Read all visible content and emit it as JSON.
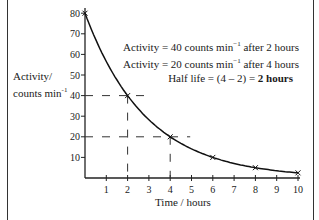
{
  "chart_data": {
    "type": "line",
    "title": "",
    "xlabel": "Time / hours",
    "ylabel": "Activity/ counts min-1",
    "ylabel_line1": "Activity/",
    "ylabel_line2": "counts min",
    "ylabel_sup": "-1",
    "xlim": [
      0,
      10
    ],
    "ylim": [
      0,
      80
    ],
    "x_ticks": [
      1,
      2,
      3,
      4,
      5,
      6,
      7,
      8,
      9,
      10
    ],
    "y_ticks": [
      10,
      20,
      30,
      40,
      50,
      60,
      70,
      80
    ],
    "grid": false,
    "legend": null,
    "series": [
      {
        "name": "Activity decay",
        "x": [
          0,
          2,
          4,
          6,
          8,
          10
        ],
        "y": [
          80,
          40,
          20,
          10,
          5,
          2.5
        ],
        "marker": "x"
      }
    ],
    "guide_lines": [
      {
        "x": 2,
        "y": 40,
        "style": "dashed"
      },
      {
        "x": 4,
        "y": 20,
        "style": "dashed"
      }
    ],
    "annotations": [
      {
        "text": "Activity = 40 counts min-1 after 2 hours"
      },
      {
        "text": "Activity = 20 counts min-1 after 4 hours"
      },
      {
        "text": "Half life = (4 – 2) = 2 hours"
      }
    ]
  },
  "labels": {
    "ylabel_line1": "Activity/",
    "ylabel_line2": "counts min",
    "ylabel_sup": "-1",
    "xlabel": "Time / hours",
    "ann1_pre": "Activity = 40 counts min",
    "ann1_sup": "−1",
    "ann1_post": " after 2 hours",
    "ann2_pre": "Activity = 20 counts min",
    "ann2_sup": "−1",
    "ann2_post": " after 4 hours",
    "ann3_pre": "Half life = (4 – 2) = ",
    "ann3_bold": "2 hours"
  }
}
